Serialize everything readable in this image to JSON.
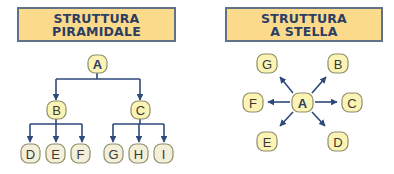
{
  "colors": {
    "title_fill": "#FCDA8C",
    "title_border": "#5F7288",
    "title_text": "#2C3E63",
    "node_fill_yellow": "#FBF4B4",
    "node_fill_light": "#F3EFD8",
    "node_border": "#9A9A78",
    "connector": "#2E4A7A"
  },
  "pyramid": {
    "title_line1": "STRUTTURA",
    "title_line2": "PIRAMIDALE",
    "root": "A",
    "level1": [
      "B",
      "C"
    ],
    "level2": [
      "D",
      "E",
      "F",
      "G",
      "H",
      "I"
    ],
    "edges": [
      [
        "A",
        "B"
      ],
      [
        "A",
        "C"
      ],
      [
        "B",
        "D"
      ],
      [
        "B",
        "E"
      ],
      [
        "B",
        "F"
      ],
      [
        "C",
        "G"
      ],
      [
        "C",
        "H"
      ],
      [
        "C",
        "I"
      ]
    ]
  },
  "star": {
    "title_line1": "STRUTTURA",
    "title_line2": "A STELLA",
    "center": "A",
    "satellites": [
      "B",
      "C",
      "D",
      "E",
      "F",
      "G"
    ],
    "edges": [
      [
        "A",
        "B"
      ],
      [
        "A",
        "C"
      ],
      [
        "A",
        "D"
      ],
      [
        "A",
        "E"
      ],
      [
        "A",
        "F"
      ],
      [
        "A",
        "G"
      ]
    ]
  }
}
